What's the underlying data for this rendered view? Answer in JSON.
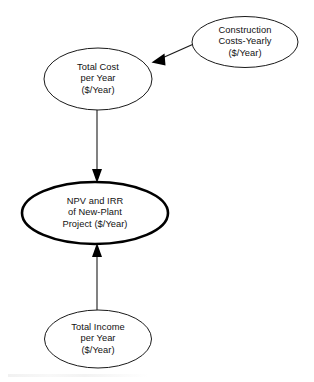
{
  "diagram": {
    "type": "flow-diagram",
    "background_color": "#ffffff",
    "text_color": "#111111",
    "stroke_color": "#1a1a1a",
    "emphasis_stroke_color": "#000000",
    "nodes": [
      {
        "id": "construction-costs",
        "shape": "ellipse",
        "emphasis": false,
        "cx": 245,
        "cy": 42,
        "rx": 53,
        "ry": 25.5,
        "lines": [
          "Construction",
          "Costs-Yearly",
          "($/Year)"
        ]
      },
      {
        "id": "total-cost",
        "shape": "ellipse",
        "emphasis": false,
        "cx": 98,
        "cy": 79,
        "rx": 54,
        "ry": 31,
        "lines": [
          "Total Cost",
          "per Year",
          "($/Year)"
        ]
      },
      {
        "id": "npv-irr",
        "shape": "ellipse",
        "emphasis": true,
        "cx": 95,
        "cy": 213,
        "rx": 73,
        "ry": 31,
        "lines": [
          "NPV and IRR",
          "of New-Plant",
          "Project ($/Year)"
        ]
      },
      {
        "id": "total-income",
        "shape": "ellipse",
        "emphasis": false,
        "cx": 98,
        "cy": 339,
        "rx": 53.5,
        "ry": 29,
        "lines": [
          "Total Income",
          "per Year",
          "($/Year)"
        ]
      }
    ],
    "edges": [
      {
        "id": "construction-to-total-cost",
        "from": "construction-costs",
        "to": "total-cost",
        "direction": "diagonal-down-left",
        "arrowhead": "to"
      },
      {
        "id": "total-cost-to-npv",
        "from": "total-cost",
        "to": "npv-irr",
        "direction": "down",
        "arrowhead": "to"
      },
      {
        "id": "total-income-to-npv",
        "from": "total-income",
        "to": "npv-irr",
        "direction": "up",
        "arrowhead": "to"
      }
    ]
  }
}
